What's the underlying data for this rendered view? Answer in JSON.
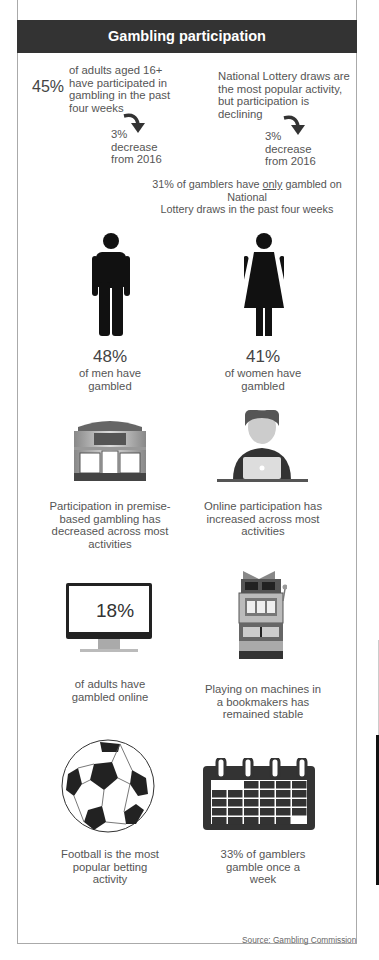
{
  "header": {
    "title": "Gambling participation"
  },
  "top_left": {
    "stat": "45%",
    "text_lines": [
      "of adults aged 16+",
      "have participated in",
      "gambling in the past",
      "four weeks"
    ],
    "change_lines": [
      "3%",
      "decrease",
      "from 2016"
    ],
    "arrow_icon": "curved-arrow-down-icon"
  },
  "top_right": {
    "text_lines": [
      "National Lottery draws are",
      "the most popular activity,",
      "but participation is",
      "declining"
    ],
    "change_lines": [
      "3%",
      "decrease",
      "from 2016"
    ],
    "arrow_icon": "curved-arrow-down-icon"
  },
  "lottery_only": {
    "before": "31% of gamblers have ",
    "emphasis": "only",
    "after": " gambled on National",
    "line2": "Lottery draws in the past four weeks"
  },
  "men": {
    "stat": "48%",
    "lines": [
      "of men have",
      "gambled"
    ],
    "icon": "man-icon"
  },
  "women": {
    "stat": "41%",
    "lines": [
      "of women have",
      "gambled"
    ],
    "icon": "woman-icon"
  },
  "premises": {
    "lines": [
      "Participation in premise-",
      "based gambling has",
      "decreased across most",
      "activities"
    ],
    "icon": "shopfront-icon"
  },
  "online": {
    "lines": [
      "Online participation has",
      "increased across most",
      "activities"
    ],
    "icon": "laptop-user-icon"
  },
  "online_adults": {
    "stat": "18%",
    "lines": [
      "of adults have",
      "gambled online"
    ],
    "icon": "monitor-icon"
  },
  "machines": {
    "lines": [
      "Playing on machines in",
      "a bookmakers has",
      "remained stable"
    ],
    "icon": "slot-machine-icon"
  },
  "football": {
    "lines": [
      "Football is the most",
      "popular betting",
      "activity"
    ],
    "icon": "football-icon"
  },
  "weekly": {
    "lines": [
      "33% of gamblers",
      "gamble once a",
      "week"
    ],
    "icon": "calendar-icon"
  },
  "source": "Source: Gambling Commission"
}
